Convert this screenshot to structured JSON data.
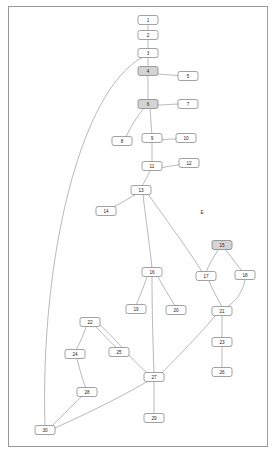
{
  "diagram": {
    "frame": {
      "x": 8,
      "y": 6,
      "width": 260,
      "height": 441
    },
    "free_labels": [
      {
        "name": "label-E",
        "text": "E",
        "x": 202,
        "y": 213
      }
    ],
    "nodes": [
      {
        "id": "1",
        "label": "1",
        "x": 148,
        "y": 20,
        "w": 20,
        "h": 9,
        "filled": false
      },
      {
        "id": "2",
        "label": "2",
        "x": 148,
        "y": 35,
        "w": 20,
        "h": 9,
        "filled": false
      },
      {
        "id": "3",
        "label": "3",
        "x": 148,
        "y": 53,
        "w": 20,
        "h": 9,
        "filled": false
      },
      {
        "id": "4",
        "label": "4",
        "x": 148,
        "y": 71,
        "w": 20,
        "h": 9,
        "filled": true
      },
      {
        "id": "5",
        "label": "5",
        "x": 188,
        "y": 76,
        "w": 20,
        "h": 9,
        "filled": false
      },
      {
        "id": "6",
        "label": "6",
        "x": 148,
        "y": 104,
        "w": 20,
        "h": 9,
        "filled": true
      },
      {
        "id": "7",
        "label": "7",
        "x": 188,
        "y": 104,
        "w": 20,
        "h": 9,
        "filled": false
      },
      {
        "id": "8",
        "label": "8",
        "x": 122,
        "y": 141,
        "w": 20,
        "h": 9,
        "filled": false
      },
      {
        "id": "9",
        "label": "9",
        "x": 152,
        "y": 138,
        "w": 20,
        "h": 9,
        "filled": false
      },
      {
        "id": "10",
        "label": "10",
        "x": 186,
        "y": 138,
        "w": 20,
        "h": 9,
        "filled": false
      },
      {
        "id": "11",
        "label": "11",
        "x": 152,
        "y": 166,
        "w": 20,
        "h": 9,
        "filled": false
      },
      {
        "id": "12",
        "label": "12",
        "x": 189,
        "y": 163,
        "w": 20,
        "h": 9,
        "filled": false
      },
      {
        "id": "13",
        "label": "13",
        "x": 141,
        "y": 190,
        "w": 20,
        "h": 9,
        "filled": false
      },
      {
        "id": "14",
        "label": "14",
        "x": 106,
        "y": 211,
        "w": 20,
        "h": 9,
        "filled": false
      },
      {
        "id": "15",
        "label": "15",
        "x": 222,
        "y": 245,
        "w": 20,
        "h": 9,
        "filled": true
      },
      {
        "id": "16",
        "label": "16",
        "x": 152,
        "y": 272,
        "w": 20,
        "h": 9,
        "filled": false
      },
      {
        "id": "17",
        "label": "17",
        "x": 206,
        "y": 276,
        "w": 20,
        "h": 9,
        "filled": false
      },
      {
        "id": "18",
        "label": "18",
        "x": 245,
        "y": 275,
        "w": 20,
        "h": 9,
        "filled": false
      },
      {
        "id": "19",
        "label": "19",
        "x": 136,
        "y": 309,
        "w": 20,
        "h": 9,
        "filled": false
      },
      {
        "id": "20",
        "label": "20",
        "x": 176,
        "y": 310,
        "w": 20,
        "h": 9,
        "filled": false
      },
      {
        "id": "21",
        "label": "21",
        "x": 222,
        "y": 311,
        "w": 20,
        "h": 9,
        "filled": false
      },
      {
        "id": "22",
        "label": "22",
        "x": 90,
        "y": 322,
        "w": 20,
        "h": 9,
        "filled": false
      },
      {
        "id": "23",
        "label": "23",
        "x": 222,
        "y": 342,
        "w": 20,
        "h": 9,
        "filled": false
      },
      {
        "id": "24",
        "label": "24",
        "x": 75,
        "y": 354,
        "w": 20,
        "h": 9,
        "filled": false
      },
      {
        "id": "25",
        "label": "25",
        "x": 119,
        "y": 352,
        "w": 20,
        "h": 9,
        "filled": false
      },
      {
        "id": "26",
        "label": "26",
        "x": 222,
        "y": 372,
        "w": 20,
        "h": 9,
        "filled": false
      },
      {
        "id": "27",
        "label": "27",
        "x": 154,
        "y": 377,
        "w": 20,
        "h": 9,
        "filled": false
      },
      {
        "id": "28",
        "label": "28",
        "x": 87,
        "y": 392,
        "w": 20,
        "h": 9,
        "filled": false
      },
      {
        "id": "29",
        "label": "29",
        "x": 154,
        "y": 418,
        "w": 20,
        "h": 9,
        "filled": false
      },
      {
        "id": "30",
        "label": "30",
        "x": 45,
        "y": 430,
        "w": 20,
        "h": 9,
        "filled": false
      }
    ],
    "edges": [
      {
        "from": "1",
        "to": "2"
      },
      {
        "from": "2",
        "to": "3"
      },
      {
        "from": "3",
        "to": "4"
      },
      {
        "from": "4",
        "to": "5"
      },
      {
        "from": "4",
        "to": "6"
      },
      {
        "from": "6",
        "to": "7"
      },
      {
        "from": "6",
        "to": "9"
      },
      {
        "from": "6",
        "to": "8"
      },
      {
        "from": "9",
        "to": "10"
      },
      {
        "from": "9",
        "to": "11"
      },
      {
        "from": "11",
        "to": "12"
      },
      {
        "from": "11",
        "to": "13"
      },
      {
        "from": "13",
        "to": "14"
      },
      {
        "from": "13",
        "to": "16"
      },
      {
        "from": "13",
        "to": "17"
      },
      {
        "from": "15",
        "to": "17"
      },
      {
        "from": "15",
        "to": "18"
      },
      {
        "from": "16",
        "to": "19"
      },
      {
        "from": "16",
        "to": "20"
      },
      {
        "from": "16",
        "to": "27"
      },
      {
        "from": "17",
        "to": "21"
      },
      {
        "from": "18",
        "to": "21"
      },
      {
        "from": "21",
        "to": "23"
      },
      {
        "from": "21",
        "to": "27"
      },
      {
        "from": "23",
        "to": "26"
      },
      {
        "from": "22",
        "to": "24"
      },
      {
        "from": "22",
        "to": "25"
      },
      {
        "from": "24",
        "to": "28"
      },
      {
        "from": "27",
        "to": "22"
      },
      {
        "from": "27",
        "to": "29"
      },
      {
        "from": "28",
        "to": "30"
      },
      {
        "from": "3",
        "to": "30"
      },
      {
        "from": "30",
        "to": "27"
      }
    ]
  }
}
